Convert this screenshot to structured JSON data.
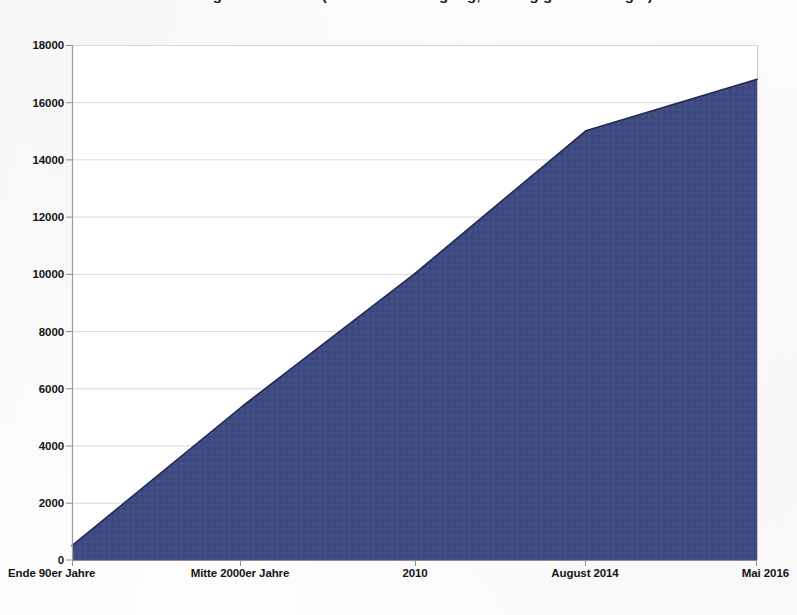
{
  "title": {
    "text": "Beschäftigte im Bereich (Bruttobeschäftigung, abhängig Beschäftigte)",
    "cropped": true
  },
  "chart_data": {
    "type": "area",
    "title": "",
    "xlabel": "",
    "ylabel": "",
    "categories": [
      "Ende 90er Jahre",
      "Mitte 2000er Jahre",
      "2010",
      "August 2014",
      "Mai 2016"
    ],
    "values": [
      500,
      5400,
      10000,
      15000,
      16800
    ],
    "ylim": [
      0,
      18000
    ],
    "ytick_step": 2000,
    "yticks": [
      "0",
      "2000",
      "4000",
      "6000",
      "8000",
      "10000",
      "12000",
      "14000",
      "16000",
      "18000"
    ],
    "grid": true,
    "grid_axis": "y",
    "legend": "none",
    "series": [
      {
        "name": "Beschäftigte",
        "values": [
          500,
          5400,
          10000,
          15000,
          16800
        ]
      }
    ],
    "colors": {
      "area_fill": "#3e4b82",
      "area_line": "#2b3360",
      "grid": "#d8d8d8",
      "axis": "#9a9a9a",
      "text": "#141414"
    }
  },
  "axis": {
    "y_labels": [
      {
        "value": 18000,
        "label": "18000"
      },
      {
        "value": 16000,
        "label": "16000"
      },
      {
        "value": 14000,
        "label": "14000"
      },
      {
        "value": 12000,
        "label": "12000"
      },
      {
        "value": 10000,
        "label": "10000"
      },
      {
        "value": 8000,
        "label": "8000"
      },
      {
        "value": 6000,
        "label": "6000"
      },
      {
        "value": 4000,
        "label": "4000"
      },
      {
        "value": 2000,
        "label": "2000"
      },
      {
        "value": 0,
        "label": "0"
      }
    ],
    "x_labels": [
      {
        "label": "Ende 90er Jahre"
      },
      {
        "label": "Mitte 2000er Jahre"
      },
      {
        "label": "2010"
      },
      {
        "label": "August 2014"
      },
      {
        "label": "Mai 2016"
      }
    ]
  }
}
